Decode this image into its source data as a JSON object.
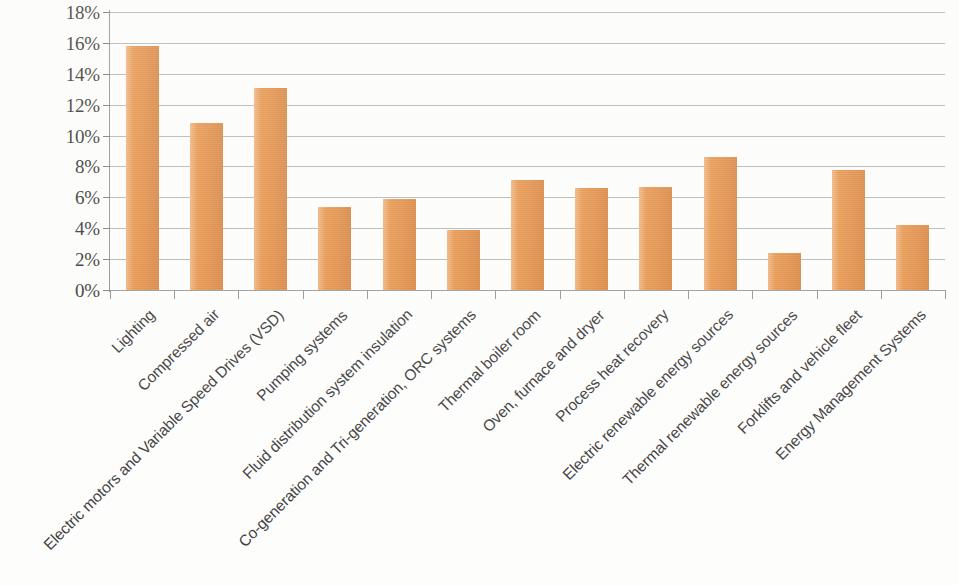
{
  "chart_data": {
    "type": "bar",
    "title": "",
    "subtitle": "",
    "xlabel": "",
    "ylabel": "",
    "ylim": [
      0,
      18
    ],
    "ytick_step": 2,
    "grid": true,
    "legend": false,
    "legend_position": "none",
    "value_unit": "%",
    "bar_color": "#E8903F",
    "gridline_color": "#9A9A9A",
    "axis_color": "#8D8D8D",
    "text_color": "#2B2B2B",
    "x_label_rotation": -45,
    "categories": [
      "Lighting",
      "Compressed air",
      "Electric motors and Variable Speed Drives (VSD)",
      "Pumping systems",
      "Fluid distribution system insulation",
      "Co-generation and Tri-generation, ORC systems",
      "Thermal boiler room",
      "Oven, furnace and dryer",
      "Process heat recovery",
      "Electric renewable energy sources",
      "Thermal renewable energy sources",
      "Forklifts and vehicle fleet",
      "Energy Management Systems"
    ],
    "values": [
      15.8,
      10.8,
      13.1,
      5.4,
      5.9,
      3.9,
      7.1,
      6.6,
      6.7,
      8.6,
      2.4,
      7.8,
      4.2
    ],
    "ytick_labels": [
      "0%",
      "2%",
      "4%",
      "6%",
      "8%",
      "10%",
      "12%",
      "14%",
      "16%",
      "18%"
    ],
    "ytick_values": [
      0,
      2,
      4,
      6,
      8,
      10,
      12,
      14,
      16,
      18
    ]
  }
}
